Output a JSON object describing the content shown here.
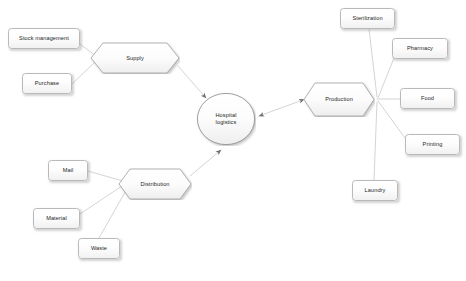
{
  "diagram": {
    "type": "flow-diagram",
    "title": "Hospital logistics",
    "canvas": {
      "width": 466,
      "height": 281
    },
    "style": {
      "background": "#ffffff",
      "node_fill": "#fbfbfb",
      "node_border": "#b9b9b9",
      "hex_border": "#9a9a9a",
      "ellipse_border": "#8f8f8f",
      "edge_color": "#c2c2c2",
      "text_color": "#1d1d1d"
    },
    "nodes": [
      {
        "id": "stock_management",
        "label": "Stock management",
        "shape": "rounded-rect",
        "x": 8,
        "y": 28,
        "w": 72,
        "h": 21
      },
      {
        "id": "purchase",
        "label": "Purchase",
        "shape": "rounded-rect",
        "x": 22,
        "y": 73,
        "w": 50,
        "h": 21
      },
      {
        "id": "supply",
        "label": "Supply",
        "shape": "hexagon",
        "x": 90,
        "y": 42,
        "w": 90,
        "h": 32
      },
      {
        "id": "hospital_logistics",
        "label": "Hospital\nlogistics",
        "shape": "ellipse",
        "x": 196,
        "y": 92,
        "w": 60,
        "h": 54
      },
      {
        "id": "production",
        "label": "Production",
        "shape": "hexagon",
        "x": 303,
        "y": 82,
        "w": 72,
        "h": 35
      },
      {
        "id": "distribution",
        "label": "Distribution",
        "shape": "hexagon",
        "x": 118,
        "y": 168,
        "w": 74,
        "h": 32
      },
      {
        "id": "sterilization",
        "label": "Sterilization",
        "shape": "rounded-rect",
        "x": 340,
        "y": 8,
        "w": 55,
        "h": 21
      },
      {
        "id": "pharmacy",
        "label": "Pharmacy",
        "shape": "rounded-rect",
        "x": 392,
        "y": 38,
        "w": 56,
        "h": 21
      },
      {
        "id": "food",
        "label": "Food",
        "shape": "rounded-rect",
        "x": 400,
        "y": 88,
        "w": 55,
        "h": 21
      },
      {
        "id": "printing",
        "label": "Printing",
        "shape": "rounded-rect",
        "x": 405,
        "y": 134,
        "w": 55,
        "h": 21
      },
      {
        "id": "laundry",
        "label": "Laundry",
        "shape": "rounded-rect",
        "x": 352,
        "y": 180,
        "w": 46,
        "h": 21
      },
      {
        "id": "mail",
        "label": "Mail",
        "shape": "rounded-rect",
        "x": 48,
        "y": 160,
        "w": 40,
        "h": 21
      },
      {
        "id": "material",
        "label": "Material",
        "shape": "rounded-rect",
        "x": 33,
        "y": 208,
        "w": 47,
        "h": 21
      },
      {
        "id": "waste",
        "label": "Waste",
        "shape": "rounded-rect",
        "x": 78,
        "y": 238,
        "w": 42,
        "h": 21
      }
    ],
    "edges": [
      {
        "from": "stock_management",
        "to": "supply",
        "arrow": "none"
      },
      {
        "from": "purchase",
        "to": "supply",
        "arrow": "none"
      },
      {
        "from": "supply",
        "to": "hospital_logistics",
        "arrow": "end"
      },
      {
        "from": "production",
        "to": "hospital_logistics",
        "arrow": "both"
      },
      {
        "from": "distribution",
        "to": "hospital_logistics",
        "arrow": "end"
      },
      {
        "from": "sterilization",
        "to": "production",
        "arrow": "none"
      },
      {
        "from": "pharmacy",
        "to": "production",
        "arrow": "none"
      },
      {
        "from": "food",
        "to": "production",
        "arrow": "none"
      },
      {
        "from": "printing",
        "to": "production",
        "arrow": "none"
      },
      {
        "from": "laundry",
        "to": "production",
        "arrow": "none"
      },
      {
        "from": "mail",
        "to": "distribution",
        "arrow": "none"
      },
      {
        "from": "material",
        "to": "distribution",
        "arrow": "none"
      },
      {
        "from": "waste",
        "to": "distribution",
        "arrow": "none"
      }
    ]
  }
}
